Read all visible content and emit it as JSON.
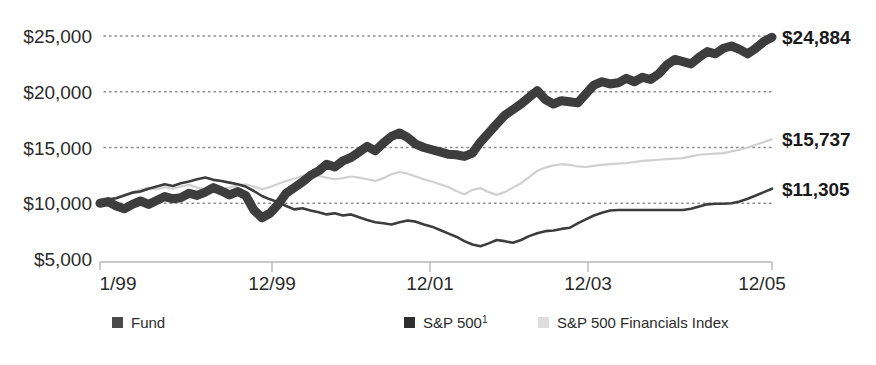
{
  "chart_data": {
    "type": "line",
    "title": "",
    "xlabel": "",
    "ylabel": "",
    "grid": "horizontal-dotted",
    "legend_position": "bottom",
    "ylim": [
      5000,
      26500
    ],
    "ytick_labels": [
      "$25,000",
      "$20,000",
      "$15,000",
      "$10,000",
      "$5,000"
    ],
    "ytick_values": [
      25000,
      20000,
      15000,
      10000,
      5000
    ],
    "xtick_labels": [
      "1/99",
      "12/99",
      "12/01",
      "12/03",
      "12/05"
    ],
    "xtick_values": [
      0,
      11,
      35,
      59,
      83
    ],
    "x_start": "1/99",
    "x_end": "12/06",
    "series": [
      {
        "name": "Fund",
        "color": "#3d3d3d",
        "style": "thick",
        "end_label": "$24,884",
        "end_value": 24884,
        "values": [
          10000,
          10150,
          9750,
          9500,
          9900,
          10200,
          9900,
          10250,
          10600,
          10400,
          10500,
          10900,
          10700,
          11000,
          11400,
          11100,
          10750,
          11050,
          10700,
          9400,
          8700,
          9100,
          9900,
          10900,
          11400,
          11900,
          12500,
          12900,
          13500,
          13250,
          13800,
          14100,
          14600,
          15100,
          14700,
          15400,
          16000,
          16300,
          15900,
          15300,
          15000,
          14800,
          14600,
          14400,
          14350,
          14200,
          14500,
          15500,
          16300,
          17100,
          17900,
          18400,
          18900,
          19500,
          20100,
          19300,
          18900,
          19200,
          19100,
          19000,
          19800,
          20600,
          20900,
          20700,
          20800,
          21200,
          20900,
          21300,
          21100,
          21600,
          22400,
          22900,
          22700,
          22500,
          23100,
          23600,
          23400,
          23900,
          24100,
          23800,
          23400,
          23900,
          24500,
          24884
        ]
      },
      {
        "name": "S&P 500",
        "color": "#3d3d3d",
        "style": "thin",
        "superscript": "1",
        "end_label": "$11,305",
        "end_value": 11305,
        "values": [
          10000,
          10350,
          10450,
          10700,
          10950,
          11050,
          11300,
          11500,
          11700,
          11550,
          11800,
          11950,
          12150,
          12300,
          12100,
          12000,
          11850,
          11700,
          11500,
          11100,
          10650,
          10350,
          10100,
          9750,
          9450,
          9550,
          9350,
          9200,
          9000,
          9100,
          8900,
          9000,
          8750,
          8500,
          8300,
          8200,
          8100,
          8300,
          8450,
          8350,
          8100,
          7900,
          7600,
          7300,
          7000,
          6600,
          6300,
          6150,
          6400,
          6700,
          6600,
          6450,
          6700,
          7050,
          7300,
          7500,
          7550,
          7700,
          7800,
          8200,
          8550,
          8900,
          9150,
          9350,
          9400,
          9400,
          9400,
          9400,
          9400,
          9400,
          9400,
          9400,
          9400,
          9500,
          9700,
          9900,
          9950,
          9950,
          10000,
          10150,
          10400,
          10700,
          11000,
          11305
        ]
      },
      {
        "name": "S&P 500 Financials Index",
        "color": "#d0d0d0",
        "style": "thin-light",
        "end_label": "$15,737",
        "end_value": 15737,
        "values": [
          10000,
          10300,
          10500,
          10750,
          11000,
          11200,
          11400,
          11250,
          11450,
          11300,
          11500,
          11650,
          11400,
          11250,
          11100,
          11250,
          11400,
          11600,
          11700,
          11500,
          11250,
          11450,
          11750,
          12000,
          12200,
          12450,
          12600,
          12450,
          12300,
          12150,
          12250,
          12400,
          12300,
          12150,
          12000,
          12250,
          12600,
          12800,
          12650,
          12400,
          12150,
          11950,
          11700,
          11450,
          11100,
          10800,
          11200,
          11350,
          11000,
          10750,
          11000,
          11400,
          11800,
          12350,
          12900,
          13200,
          13400,
          13500,
          13450,
          13300,
          13250,
          13350,
          13450,
          13500,
          13550,
          13600,
          13700,
          13800,
          13850,
          13900,
          13950,
          14000,
          14050,
          14200,
          14350,
          14400,
          14450,
          14500,
          14650,
          14800,
          15000,
          15250,
          15500,
          15737
        ]
      }
    ]
  },
  "legend": {
    "items": [
      {
        "label": "Fund",
        "swatch_color": "#4a4a4a"
      },
      {
        "label": "S&P 500",
        "superscript": "1",
        "swatch_color": "#2e2e2e"
      },
      {
        "label": "S&P 500 Financials Index",
        "swatch_color": "#dedede"
      }
    ]
  }
}
